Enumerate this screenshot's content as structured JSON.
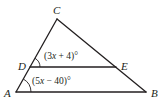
{
  "diagram": {
    "type": "triangle-with-parallel-segment",
    "vertices": {
      "A": {
        "label": "A",
        "x": 16,
        "y": 92
      },
      "B": {
        "label": "B",
        "x": 146,
        "y": 92
      },
      "C": {
        "label": "C",
        "x": 57,
        "y": 19
      },
      "D": {
        "label": "D",
        "x": 30,
        "y": 67
      },
      "E": {
        "label": "E",
        "x": 116,
        "y": 67
      }
    },
    "segments": [
      "AB",
      "BC",
      "CA",
      "DE"
    ],
    "angles": {
      "CDE": {
        "label_pre": "(3",
        "var": "x",
        "label_post": " + 4)°"
      },
      "DAB": {
        "label_pre": "(5",
        "var": "x",
        "label_post": " − 40)°"
      }
    },
    "colors": {
      "stroke": "#231f20",
      "background": "#ffffff"
    }
  }
}
